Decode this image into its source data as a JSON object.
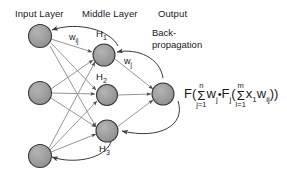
{
  "diagram": {
    "title_row": {
      "input_layer": "Input Layer",
      "middle_layer": "Middle Layer",
      "output": "Output"
    },
    "node_labels": {
      "h1": "H",
      "h1_sub": "1",
      "h2": "H",
      "h2_sub": "2",
      "h3": "H",
      "h3_sub": "3"
    },
    "weight_labels": {
      "w_ij": "w",
      "w_ij_sub": "ij",
      "w_j": "w",
      "w_j_sub": "j"
    },
    "backpropagation": {
      "line1": "Back-",
      "line2": "propagation"
    },
    "formula": {
      "f_outer": "F(",
      "sum1_top": "n",
      "sum1_sym": "Σ",
      "sum1_bot": "j=1",
      "w_j": "w",
      "w_j_sub": "j",
      "dot": "•",
      "f_inner": "F",
      "f_inner_sub": "j",
      "open_paren": "(",
      "sum2_top": "m",
      "sum2_sym": "Σ",
      "sum2_bot": "l=1",
      "x1": "x",
      "x1_sub": "1",
      "w_ij": "w",
      "w_ij_sub": "ij",
      "close": "))"
    },
    "colors": {
      "node_fill": "#9a9a9a",
      "node_stroke": "#3a3a3a",
      "edge": "#8a8a8a",
      "arrow": "#4a4a4a",
      "text": "#1a1a1a",
      "background": "#ffffff"
    },
    "nodes": [
      {
        "id": "i1",
        "cx": 40,
        "cy": 36,
        "r": 11.5,
        "layer": "input"
      },
      {
        "id": "i2",
        "cx": 40,
        "cy": 93,
        "r": 11.5,
        "layer": "input"
      },
      {
        "id": "i3",
        "cx": 40,
        "cy": 156,
        "r": 11.5,
        "layer": "input"
      },
      {
        "id": "h1",
        "cx": 104,
        "cy": 55,
        "r": 11.0,
        "layer": "hidden"
      },
      {
        "id": "h2",
        "cx": 107,
        "cy": 95,
        "r": 10.5,
        "layer": "hidden"
      },
      {
        "id": "h3",
        "cx": 107,
        "cy": 131,
        "r": 11.0,
        "layer": "hidden"
      },
      {
        "id": "o1",
        "cx": 163,
        "cy": 94,
        "r": 11.0,
        "layer": "output"
      }
    ]
  }
}
